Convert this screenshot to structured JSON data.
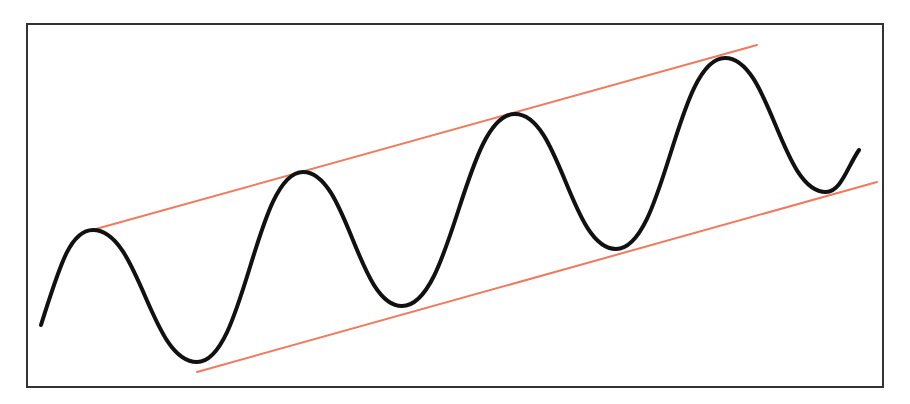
{
  "diagram": {
    "type": "ascending-channel",
    "frame": {
      "x": 27,
      "y": 24,
      "width": 856,
      "height": 363,
      "stroke": "#333333"
    },
    "price_curve": {
      "color": "#111111",
      "stroke_width": 4,
      "points": [
        [
          41,
          325
        ],
        [
          93,
          230
        ],
        [
          197,
          362
        ],
        [
          303,
          172
        ],
        [
          402,
          306
        ],
        [
          515,
          114
        ],
        [
          616,
          249
        ],
        [
          725,
          58
        ],
        [
          826,
          192
        ],
        [
          859,
          150
        ]
      ]
    },
    "upper_channel_line": {
      "color": "#f07a5e",
      "x1": 85,
      "y1": 232,
      "x2": 757,
      "y2": 45
    },
    "lower_channel_line": {
      "color": "#f07a5e",
      "x1": 197,
      "y1": 372,
      "x2": 877,
      "y2": 182
    }
  }
}
